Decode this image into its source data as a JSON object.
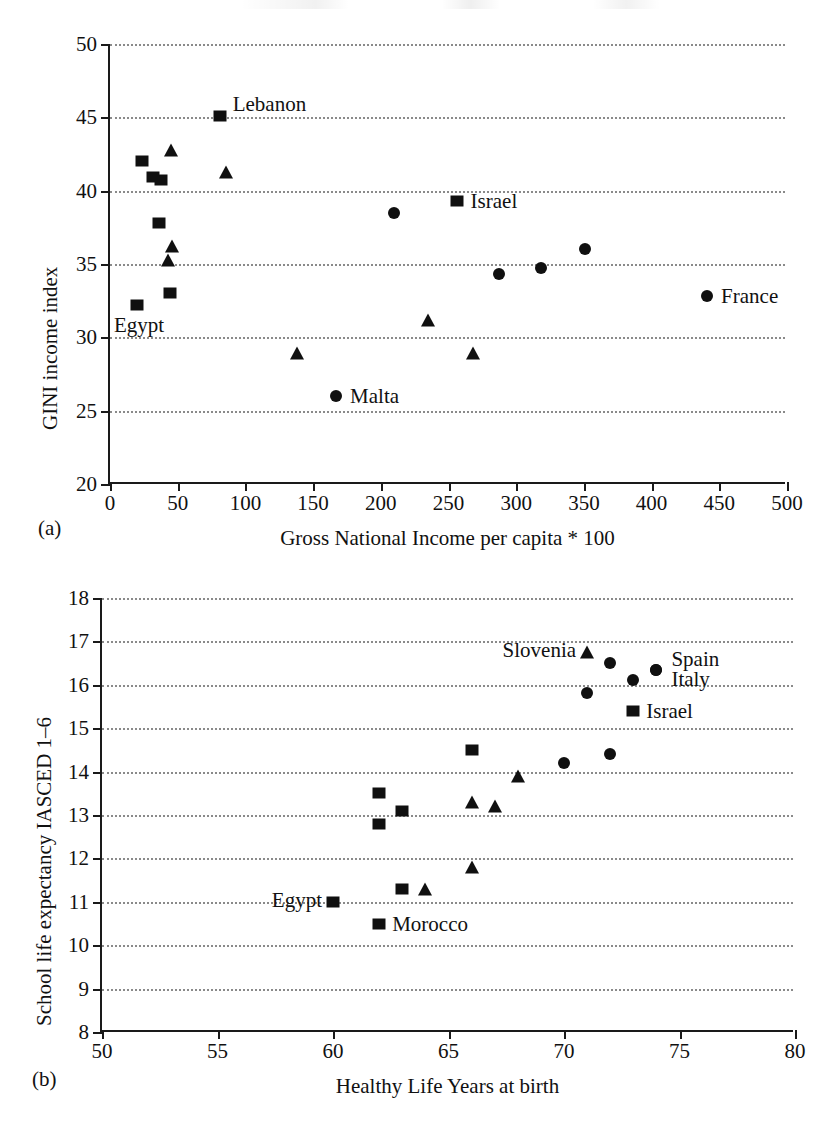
{
  "figure": {
    "panel_a_tag": "(a)",
    "panel_b_tag": "(b)"
  },
  "chart_data": [
    {
      "type": "scatter",
      "panel": "(a)",
      "title": "",
      "xlabel": "Gross National Income per capita * 100",
      "ylabel": "GINI income index",
      "xlim": [
        0,
        500
      ],
      "ylim": [
        20,
        50
      ],
      "xticks": [
        0,
        50,
        100,
        150,
        200,
        250,
        300,
        350,
        400,
        450,
        500
      ],
      "yticks": [
        20,
        25,
        30,
        35,
        40,
        45,
        50
      ],
      "grid": "horizontal-dotted",
      "legend": "none",
      "series": [
        {
          "name": "square",
          "marker": "square",
          "points": [
            {
              "x": 20,
              "y": 32.2,
              "label": "Egypt",
              "label_pos": "below"
            },
            {
              "x": 24,
              "y": 42.0,
              "label": ""
            },
            {
              "x": 32,
              "y": 40.9,
              "label": ""
            },
            {
              "x": 38,
              "y": 40.75,
              "label": ""
            },
            {
              "x": 36,
              "y": 37.8,
              "label": ""
            },
            {
              "x": 44,
              "y": 33.0,
              "label": ""
            },
            {
              "x": 81,
              "y": 45.1,
              "label": "Lebanon",
              "label_pos": "right-above"
            },
            {
              "x": 256,
              "y": 39.3,
              "label": "Israel",
              "label_pos": "right"
            }
          ]
        },
        {
          "name": "triangle",
          "marker": "triangle",
          "points": [
            {
              "x": 45,
              "y": 42.8,
              "label": ""
            },
            {
              "x": 86,
              "y": 41.3,
              "label": ""
            },
            {
              "x": 46,
              "y": 36.2,
              "label": ""
            },
            {
              "x": 43,
              "y": 35.3,
              "label": ""
            },
            {
              "x": 138,
              "y": 28.9,
              "label": ""
            },
            {
              "x": 235,
              "y": 31.2,
              "label": ""
            },
            {
              "x": 268,
              "y": 28.9,
              "label": ""
            }
          ]
        },
        {
          "name": "circle",
          "marker": "circle",
          "points": [
            {
              "x": 167,
              "y": 26.0,
              "label": "Malta",
              "label_pos": "right"
            },
            {
              "x": 210,
              "y": 38.5,
              "label": ""
            },
            {
              "x": 287,
              "y": 34.3,
              "label": ""
            },
            {
              "x": 318,
              "y": 34.7,
              "label": ""
            },
            {
              "x": 351,
              "y": 36.0,
              "label": ""
            },
            {
              "x": 441,
              "y": 32.8,
              "label": "France",
              "label_pos": "right"
            }
          ]
        }
      ]
    },
    {
      "type": "scatter",
      "panel": "(b)",
      "title": "",
      "xlabel": "Healthy Life Years at birth",
      "ylabel": "School life expectancy IASCED 1–6",
      "xlim": [
        50,
        80
      ],
      "ylim": [
        8,
        18
      ],
      "xticks": [
        50,
        55,
        60,
        65,
        70,
        75,
        80
      ],
      "yticks": [
        8,
        9,
        10,
        11,
        12,
        13,
        14,
        15,
        16,
        17,
        18
      ],
      "grid": "horizontal-dotted",
      "legend": "none",
      "series": [
        {
          "name": "square",
          "marker": "square",
          "points": [
            {
              "x": 60.0,
              "y": 11.0,
              "label": "Egypt",
              "label_pos": "left"
            },
            {
              "x": 62.0,
              "y": 10.5,
              "label": "Morocco",
              "label_pos": "right"
            },
            {
              "x": 62.0,
              "y": 13.5,
              "label": ""
            },
            {
              "x": 62.0,
              "y": 12.8,
              "label": ""
            },
            {
              "x": 63.0,
              "y": 13.1,
              "label": ""
            },
            {
              "x": 63.0,
              "y": 11.3,
              "label": ""
            },
            {
              "x": 66.0,
              "y": 14.5,
              "label": ""
            },
            {
              "x": 73.0,
              "y": 15.4,
              "label": "Israel",
              "label_pos": "right"
            }
          ]
        },
        {
          "name": "triangle",
          "marker": "triangle",
          "points": [
            {
              "x": 64.0,
              "y": 11.3,
              "label": ""
            },
            {
              "x": 66.0,
              "y": 11.8,
              "label": ""
            },
            {
              "x": 66.0,
              "y": 13.3,
              "label": ""
            },
            {
              "x": 67.0,
              "y": 13.2,
              "label": ""
            },
            {
              "x": 68.0,
              "y": 13.9,
              "label": ""
            },
            {
              "x": 71.0,
              "y": 16.75,
              "label": "Slovenia",
              "label_pos": "left"
            }
          ]
        },
        {
          "name": "circle",
          "marker": "circle",
          "points": [
            {
              "x": 70.0,
              "y": 14.2,
              "label": ""
            },
            {
              "x": 71.0,
              "y": 15.8,
              "label": ""
            },
            {
              "x": 72.0,
              "y": 16.5,
              "label": ""
            },
            {
              "x": 72.0,
              "y": 14.4,
              "label": ""
            },
            {
              "x": 73.0,
              "y": 16.1,
              "label": ""
            },
            {
              "x": 74.0,
              "y": 16.35,
              "label": "Spain",
              "label_pos": "right-above"
            },
            {
              "x": 74.0,
              "y": 16.35,
              "label": "Italy",
              "label_pos": "right-below"
            }
          ]
        }
      ]
    }
  ]
}
